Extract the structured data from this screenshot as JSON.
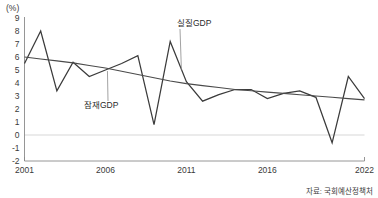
{
  "unit_label": "(%)",
  "source_note": "자료: 국회예산정책처",
  "labels": {
    "actual_series": "실질GDP",
    "potential_series": "잠재GDP"
  },
  "chart_data": {
    "type": "line",
    "title": "",
    "subtitle": "",
    "xlabel": "",
    "ylabel": "(%)",
    "unit": "%",
    "grid": false,
    "zero_line": true,
    "legend_position": "inline-annotation",
    "xlim": [
      2001,
      2022
    ],
    "ylim": [
      -2,
      9
    ],
    "yticks": [
      9,
      8,
      7,
      6,
      5,
      4,
      3,
      2,
      1,
      0,
      -1,
      -2
    ],
    "ytick_labels": [
      "9",
      "8",
      "7",
      "6",
      "5",
      "4",
      "3",
      "2",
      "1",
      "0",
      "-1",
      "-2"
    ],
    "xticks": [
      2001,
      2006,
      2011,
      2016,
      2022
    ],
    "xtick_labels": [
      "2001",
      "2006",
      "2011",
      "2016",
      "2022"
    ],
    "x": [
      2001,
      2002,
      2003,
      2004,
      2005,
      2006,
      2007,
      2008,
      2009,
      2010,
      2011,
      2012,
      2013,
      2014,
      2015,
      2016,
      2017,
      2018,
      2019,
      2020,
      2021,
      2022
    ],
    "series": [
      {
        "name": "실질GDP",
        "color": "#3b3b3b",
        "values": [
          5.5,
          8.0,
          3.4,
          5.6,
          4.5,
          5.0,
          5.5,
          6.1,
          0.8,
          7.2,
          4.1,
          2.6,
          3.1,
          3.5,
          3.5,
          2.8,
          3.2,
          3.4,
          2.9,
          -0.6,
          4.5,
          2.8
        ]
      },
      {
        "name": "잠재GDP",
        "color": "#4a4a4a",
        "values": [
          6.0,
          5.85,
          5.7,
          5.55,
          5.35,
          5.15,
          4.9,
          4.65,
          4.4,
          4.15,
          3.95,
          3.8,
          3.65,
          3.5,
          3.4,
          3.3,
          3.2,
          3.1,
          3.0,
          2.9,
          2.8,
          2.7
        ]
      }
    ],
    "annotations": [
      {
        "text": "실질GDP",
        "points_to_series": "실질GDP",
        "points_to_year": 2011
      },
      {
        "text": "잠재GDP",
        "points_to_series": "잠재GDP",
        "points_to_year": 2006
      }
    ]
  }
}
